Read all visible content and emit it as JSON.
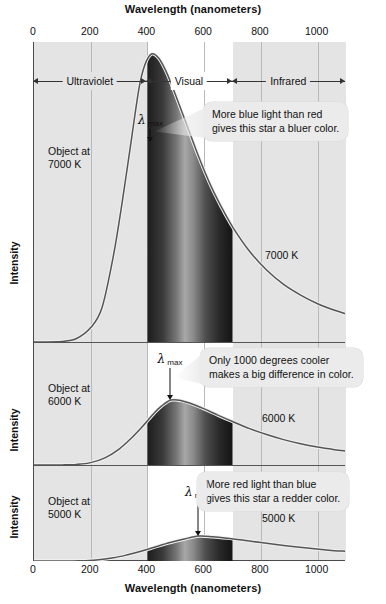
{
  "axes": {
    "top_title": "Wavelength (nanometers)",
    "bottom_title": "Wavelength (nanometers)",
    "y_label": "Intensity",
    "tick_labels": [
      "0",
      "200",
      "400",
      "600",
      "800",
      "1000"
    ],
    "tick_values": [
      0,
      200,
      400,
      600,
      800,
      1000
    ],
    "x_min": 0,
    "x_max": 1100
  },
  "regions": [
    {
      "name": "Ultraviolet",
      "start": 0,
      "end": 400,
      "shaded": true
    },
    {
      "name": "Visual",
      "start": 400,
      "end": 700,
      "shaded": false
    },
    {
      "name": "Infrared",
      "start": 700,
      "end": 1100,
      "shaded": true
    }
  ],
  "panels": [
    {
      "id": "panel-7000k",
      "object_label": "Object at\n7000 K",
      "curve_label": "7000 K",
      "lambda_max_label": "λ max",
      "lambda_max_nm": 414,
      "temperature_k": 7000,
      "callout": "More blue light than red\ngives this star a bluer color."
    },
    {
      "id": "panel-6000k",
      "object_label": "Object at\n6000 K",
      "curve_label": "6000 K",
      "lambda_max_label": "λ max",
      "lambda_max_nm": 483,
      "temperature_k": 6000,
      "callout": "Only 1000 degrees cooler\nmakes a big difference in color."
    },
    {
      "id": "panel-5000k",
      "object_label": "Object at\n5000 K",
      "curve_label": "5000 K",
      "lambda_max_label": "λ max",
      "lambda_max_nm": 580,
      "temperature_k": 5000,
      "callout": "More red light than blue\ngives this star a redder color."
    }
  ],
  "colors": {
    "shaded_zone": "#e4e4e4",
    "visual_zone": "#ffffff",
    "gridline": "#b9b9b9",
    "axis": "#4a4a4a",
    "curve": "#555555",
    "callout_bg": "#ebebeb",
    "spectrum_band": "#2b2b2b",
    "text": "#111111"
  },
  "chart_data": {
    "type": "line",
    "xlabel": "Wavelength (nanometers)",
    "ylabel": "Intensity",
    "xlim": [
      0,
      1100
    ],
    "ylim": [
      0,
      1
    ],
    "grid": true,
    "legend": "inline curve labels",
    "xticks": [
      0,
      200,
      400,
      600,
      800,
      1000
    ],
    "annotations": [
      "More blue light than red gives this star a bluer color.",
      "Only 1000 degrees cooler makes a big difference in color.",
      "More red light than blue gives this star a redder color."
    ],
    "bands": [
      {
        "label": "Ultraviolet",
        "range": [
          0,
          400
        ]
      },
      {
        "label": "Visual",
        "range": [
          400,
          700
        ]
      },
      {
        "label": "Infrared",
        "range": [
          700,
          1100
        ]
      }
    ],
    "series": [
      {
        "name": "7000 K",
        "temperature_k": 7000,
        "lambda_max_nm": 414,
        "peak_relative_intensity": 1.0,
        "x": [
          0,
          100,
          150,
          200,
          240,
          280,
          310,
          340,
          370,
          390,
          414,
          440,
          470,
          500,
          540,
          580,
          620,
          660,
          700,
          760,
          820,
          880,
          940,
          1000,
          1060,
          1100
        ],
        "y": [
          0,
          0.002,
          0.012,
          0.05,
          0.12,
          0.3,
          0.48,
          0.68,
          0.88,
          0.96,
          1.0,
          0.985,
          0.93,
          0.855,
          0.75,
          0.645,
          0.55,
          0.47,
          0.4,
          0.315,
          0.25,
          0.2,
          0.163,
          0.133,
          0.11,
          0.098
        ]
      },
      {
        "name": "6000 K",
        "temperature_k": 6000,
        "lambda_max_nm": 483,
        "peak_relative_intensity": 0.55,
        "x": [
          0,
          100,
          150,
          200,
          250,
          300,
          340,
          380,
          420,
          450,
          483,
          520,
          560,
          600,
          650,
          700,
          760,
          820,
          880,
          940,
          1000,
          1060,
          1100
        ],
        "y": [
          0,
          0.001,
          0.005,
          0.02,
          0.06,
          0.135,
          0.22,
          0.32,
          0.43,
          0.5,
          0.55,
          0.545,
          0.515,
          0.475,
          0.42,
          0.368,
          0.308,
          0.258,
          0.215,
          0.18,
          0.152,
          0.13,
          0.118
        ]
      },
      {
        "name": "5000 K",
        "temperature_k": 5000,
        "lambda_max_nm": 580,
        "peak_relative_intensity": 0.27,
        "x": [
          0,
          100,
          160,
          220,
          280,
          330,
          380,
          430,
          480,
          530,
          580,
          630,
          680,
          740,
          800,
          860,
          920,
          980,
          1040,
          1100
        ],
        "y": [
          0,
          0.0005,
          0.003,
          0.012,
          0.035,
          0.068,
          0.108,
          0.155,
          0.2,
          0.238,
          0.27,
          0.263,
          0.248,
          0.225,
          0.2,
          0.176,
          0.154,
          0.135,
          0.118,
          0.105
        ]
      }
    ]
  }
}
